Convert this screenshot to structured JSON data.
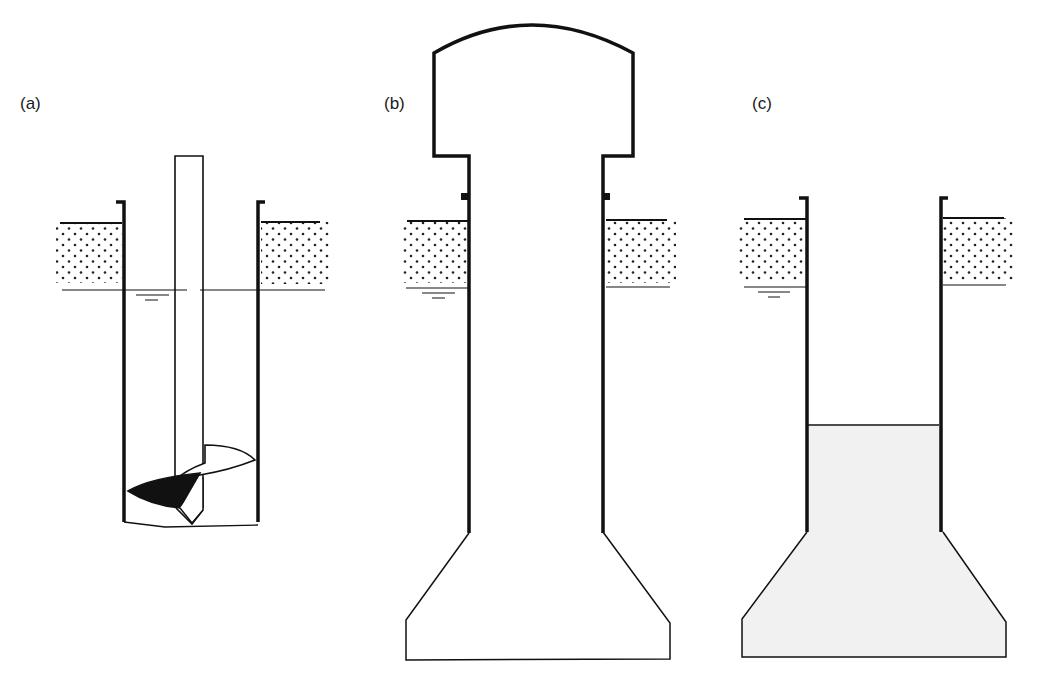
{
  "figure": {
    "panels": [
      {
        "id": "a",
        "label": "(a)",
        "description": "Auger drilling inside temporary casing through soil below water table"
      },
      {
        "id": "b",
        "label": "(b)",
        "description": "Under-reaming bell at base of casing, cased shaft"
      },
      {
        "id": "c",
        "label": "(c)",
        "description": "Concrete placed filling bell and lower shaft"
      }
    ]
  },
  "colors": {
    "line": "#111111",
    "soil_dot": "#222222",
    "concrete_fill": "#f1f1f1",
    "auger_blade": "#111111",
    "background": "#ffffff"
  }
}
